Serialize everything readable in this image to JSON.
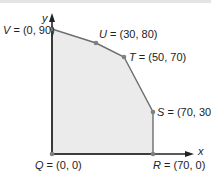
{
  "diagram": {
    "type": "feasible-region",
    "axes": {
      "x_label": "x",
      "y_label": "y"
    },
    "colors": {
      "fill": "#ebebeb",
      "edge": "#6e6e6e",
      "axis": "#222222",
      "vertex": "#808080"
    },
    "vertices": [
      {
        "name": "Q",
        "text": "(0, 0)",
        "x": 0,
        "y": 0
      },
      {
        "name": "R",
        "text": "(70, 0)",
        "x": 70,
        "y": 0
      },
      {
        "name": "S",
        "text": "(70, 30)",
        "x": 70,
        "y": 30
      },
      {
        "name": "T",
        "text": "(50, 70)",
        "x": 50,
        "y": 70
      },
      {
        "name": "U",
        "text": "(30, 80)",
        "x": 30,
        "y": 80
      },
      {
        "name": "V",
        "text": "(0, 90)",
        "x": 0,
        "y": 90
      }
    ]
  }
}
